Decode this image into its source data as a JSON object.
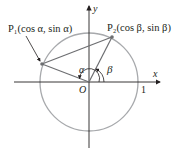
{
  "diagram": {
    "axes": {
      "x_label": "x",
      "y_label": "y",
      "origin_label": "O",
      "unit_label": "1"
    },
    "points": [
      {
        "name": "P1",
        "label": "P₁(cos α, sin α)",
        "angle_label": "α"
      },
      {
        "name": "P2",
        "label": "P₂(cos β, sin β)",
        "angle_label": "β"
      }
    ],
    "colors": {
      "circle": "#a7a9ac",
      "lines": "#6d6e71",
      "axes": "#231f20",
      "text": "#231f20"
    }
  }
}
